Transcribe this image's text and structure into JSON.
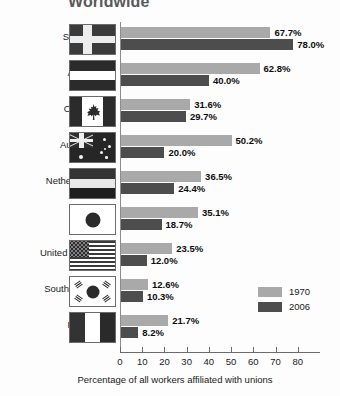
{
  "chart_data": {
    "type": "bar",
    "orientation": "horizontal",
    "title": "Worldwide",
    "xlabel": "Percentage of all workers affiliated with unions",
    "ylabel": "",
    "xlim": [
      0,
      90
    ],
    "xticks": [
      0,
      10,
      20,
      30,
      40,
      50,
      60,
      70,
      80
    ],
    "grid": false,
    "legend_position": "right-lower",
    "categories": [
      "Sweden",
      "Austria",
      "Canada",
      "Australia",
      "Netherlands",
      "Japan",
      "United States",
      "South Korea",
      "France"
    ],
    "series": [
      {
        "name": "1970",
        "color": "#a9a9a9",
        "values": [
          67.7,
          62.8,
          31.6,
          50.2,
          36.5,
          35.1,
          23.5,
          12.6,
          21.7
        ],
        "labels": [
          "67.7%",
          "62.8%",
          "31.6%",
          "50.2%",
          "36.5%",
          "35.1%",
          "23.5%",
          "12.6%",
          "21.7%"
        ]
      },
      {
        "name": "2006",
        "color": "#4d4d4d",
        "values": [
          78.0,
          40.0,
          29.7,
          20.0,
          24.4,
          18.7,
          12.0,
          10.3,
          8.2
        ],
        "labels": [
          "78.0%",
          "40.0%",
          "29.7%",
          "20.0%",
          "24.4%",
          "18.7%",
          "12.0%",
          "10.3%",
          "8.2%"
        ]
      }
    ]
  },
  "rows": [
    {
      "country": "Sweden",
      "flag": "sweden-flag",
      "v1970": 67.7,
      "v2006": 78.0,
      "l1970": "67.7%",
      "l2006": "78.0%"
    },
    {
      "country": "Austria",
      "flag": "austria-flag",
      "v1970": 62.8,
      "v2006": 40.0,
      "l1970": "62.8%",
      "l2006": "40.0%"
    },
    {
      "country": "Canada",
      "flag": "canada-flag",
      "v1970": 31.6,
      "v2006": 29.7,
      "l1970": "31.6%",
      "l2006": "29.7%"
    },
    {
      "country": "Australia",
      "flag": "australia-flag",
      "v1970": 50.2,
      "v2006": 20.0,
      "l1970": "50.2%",
      "l2006": "20.0%"
    },
    {
      "country": "Netherlands",
      "flag": "netherlands-flag",
      "v1970": 36.5,
      "v2006": 24.4,
      "l1970": "36.5%",
      "l2006": "24.4%"
    },
    {
      "country": "Japan",
      "flag": "japan-flag",
      "v1970": 35.1,
      "v2006": 18.7,
      "l1970": "35.1%",
      "l2006": "18.7%"
    },
    {
      "country": "United States",
      "flag": "united-states-flag",
      "v1970": 23.5,
      "v2006": 12.0,
      "l1970": "23.5%",
      "l2006": "12.0%"
    },
    {
      "country": "South Korea",
      "flag": "south-korea-flag",
      "v1970": 12.6,
      "v2006": 10.3,
      "l1970": "12.6%",
      "l2006": "10.3%"
    },
    {
      "country": "France",
      "flag": "france-flag",
      "v1970": 21.7,
      "v2006": 8.2,
      "l1970": "21.7%",
      "l2006": "8.2%"
    }
  ],
  "axis": {
    "ticks": [
      "0",
      "10",
      "20",
      "30",
      "40",
      "50",
      "60",
      "70",
      "80"
    ],
    "label": "Percentage of all workers affiliated with unions"
  },
  "legend": {
    "items": [
      {
        "label": "1970",
        "color": "#a9a9a9"
      },
      {
        "label": "2006",
        "color": "#4d4d4d"
      }
    ]
  },
  "colors": {
    "series_1970": "#a9a9a9",
    "series_2006": "#4d4d4d",
    "title": "#595959",
    "axis": "#6b6b6b",
    "background": "#fdfdfd"
  }
}
